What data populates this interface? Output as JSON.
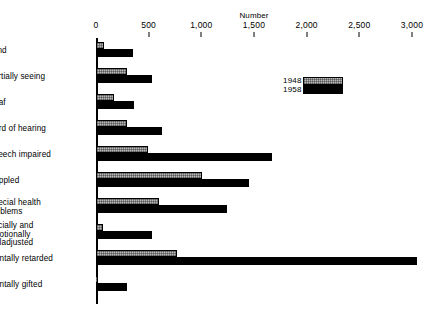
{
  "chart_data": {
    "type": "bar",
    "orientation": "horizontal",
    "title": "",
    "xlabel": "Number",
    "ylabel": "",
    "xlim": [
      0,
      3000
    ],
    "xticks": [
      0,
      500,
      1000,
      1500,
      2000,
      2500,
      3000
    ],
    "xtick_labels": [
      "0",
      "500",
      "1,000",
      "1,500",
      "2,000",
      "2,500",
      "3,000"
    ],
    "grid": false,
    "legend_position": "upper-right-inside",
    "categories": [
      "Blind",
      "Partially seeing",
      "Deaf",
      "Hard of hearing",
      "Speech impaired",
      "Crippled",
      "Special health problems",
      "Socially and emotionally maladjusted",
      "Mentally retarded",
      "Mentally gifted"
    ],
    "series": [
      {
        "name": "1948",
        "color": "#b9b9b9",
        "values": [
          75,
          290,
          170,
          290,
          490,
          1010,
          600,
          70,
          770,
          20
        ]
      },
      {
        "name": "1958",
        "color": "#000000",
        "values": [
          350,
          530,
          360,
          630,
          1670,
          1450,
          1240,
          530,
          3050,
          290
        ]
      }
    ]
  },
  "axis": {
    "title": "Number"
  },
  "legend": {
    "entries": [
      {
        "label": "1948"
      },
      {
        "label": "1958"
      }
    ]
  },
  "rows": [
    {
      "label": "Blind",
      "lines": 1
    },
    {
      "label": "Partially seeing",
      "lines": 1
    },
    {
      "label": "Deaf",
      "lines": 1
    },
    {
      "label": "Hard of hearing",
      "lines": 1
    },
    {
      "label": "Speech impaired",
      "lines": 1
    },
    {
      "label": "Crippled",
      "lines": 1
    },
    {
      "label": "Special health\nproblems",
      "lines": 2
    },
    {
      "label": "Socially and\nemotionally\nmaladjusted",
      "lines": 3
    },
    {
      "label": "Mentally retarded",
      "lines": 1
    },
    {
      "label": "Mentally gifted",
      "lines": 1
    }
  ],
  "footnote": ""
}
